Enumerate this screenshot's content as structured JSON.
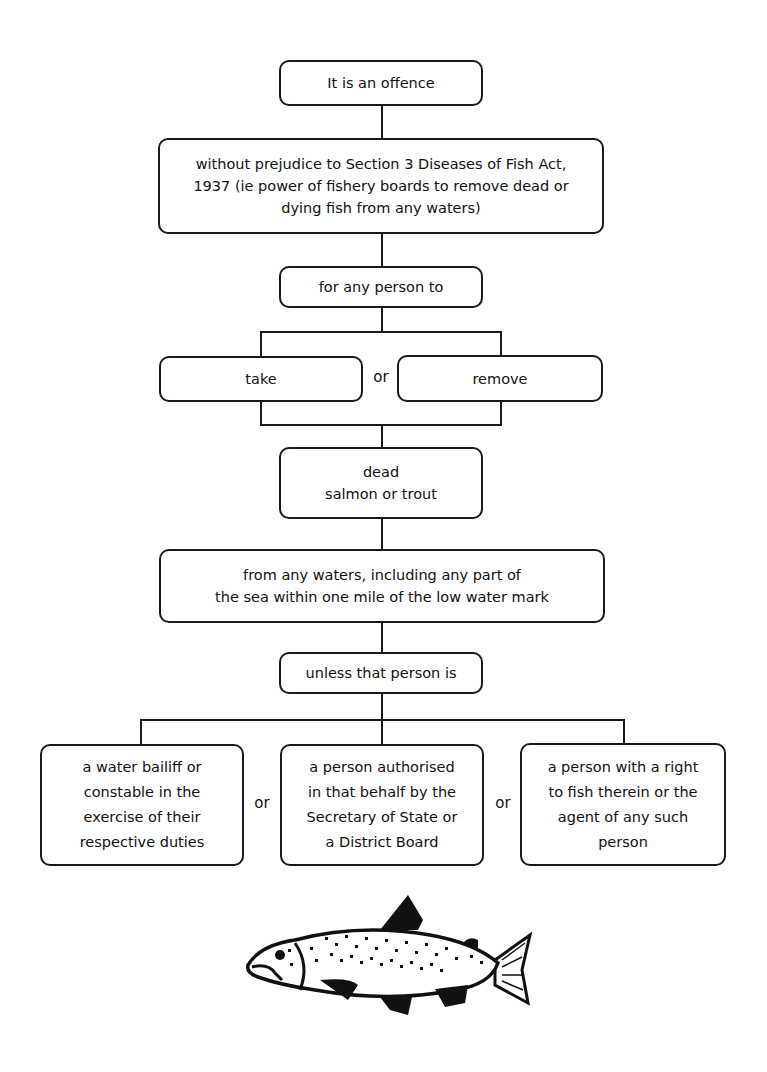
{
  "diagram": {
    "nodes": {
      "offence": "It is an offence",
      "without_prejudice": "without prejudice to Section 3 Diseases of Fish Act, 1937 (ie power of fishery boards to remove dead or dying fish from any waters)",
      "person_to": "for any person to",
      "take": "take",
      "remove": "remove",
      "dead_fish": [
        "dead",
        "salmon or trout"
      ],
      "waters": [
        "from any waters, including any part of",
        "the sea within one mile of the low water mark"
      ],
      "unless": "unless that person is",
      "exception_1": [
        "a water bailiff or",
        "constable in the",
        "exercise of their",
        "respective duties"
      ],
      "exception_2": [
        "a person authorised",
        "in that behalf by the",
        "Secretary of State or",
        "a District Board"
      ],
      "exception_3": [
        "a person with a right",
        "to fish therein or the",
        "agent of any such",
        "person"
      ]
    },
    "connectors": {
      "or_1": "or",
      "or_2": "or",
      "or_3": "or"
    },
    "illustration": "trout-illustration"
  }
}
